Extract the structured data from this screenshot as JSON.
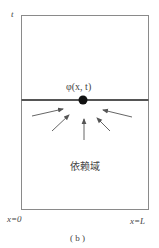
{
  "diagram": {
    "axis_label_t": "t",
    "point_label": "φ(x, t)",
    "region_label": "依赖域",
    "left_boundary_label": "x=0",
    "right_boundary_label": "x=L",
    "caption": "( b )",
    "colors": {
      "frame": "#8a8a8a",
      "time_line": "#555555",
      "point": "#111111",
      "arrow": "#555555",
      "text": "#444444"
    },
    "arrows_count": 5
  }
}
